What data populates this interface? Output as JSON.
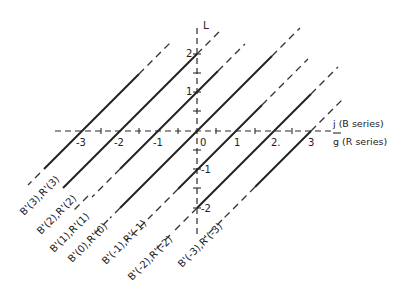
{
  "diagram": {
    "vertical_axis_label": "L",
    "horizontal_axis_labels": {
      "top": "j (B series)",
      "bottom": "g (R series)"
    },
    "horizontal_ticks": [
      "-3",
      "-2",
      "-1",
      "0",
      "1",
      "2.",
      "3"
    ],
    "vertical_ticks": [
      "2",
      "1",
      "-1",
      "-2"
    ],
    "lines": [
      {
        "label": "B'(3),R'(3)",
        "intercept": -3
      },
      {
        "label": "B'(2),R'(2)",
        "intercept": -2
      },
      {
        "label": "B'(1),R'(1)",
        "intercept": -1
      },
      {
        "label": "B'(0),R'(0)",
        "intercept": 0
      },
      {
        "label": "B'(-1),R'(-1)",
        "intercept": 1
      },
      {
        "label": "B'(-2),R'(-2)",
        "intercept": 2
      },
      {
        "label": "B'(-3),R'(-3)",
        "intercept": 3
      }
    ],
    "colors": {
      "ink": "#222222",
      "background": "#ffffff"
    }
  }
}
